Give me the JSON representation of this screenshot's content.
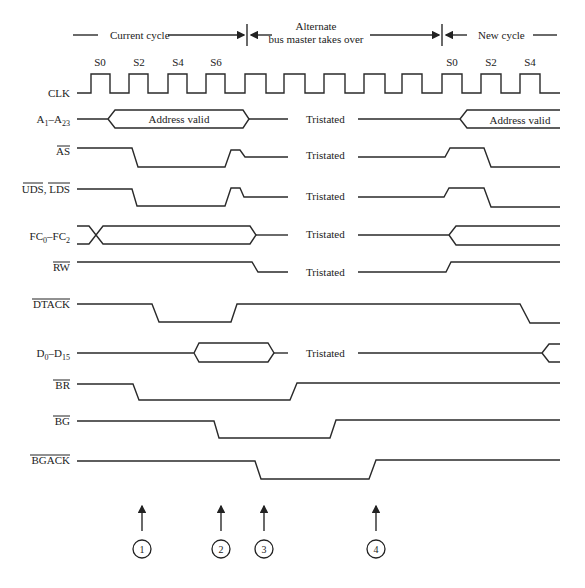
{
  "header": {
    "current_cycle": "Current cycle",
    "alternate_line1": "Alternate",
    "alternate_line2": "bus master takes over",
    "new_cycle": "New cycle",
    "dividers_x": [
      247,
      442
    ]
  },
  "clock": {
    "label": "CLK",
    "state_labels": [
      {
        "text": "S0",
        "x": 100
      },
      {
        "text": "S2",
        "x": 139
      },
      {
        "text": "S4",
        "x": 178
      },
      {
        "text": "S6",
        "x": 216
      },
      {
        "text": "S0",
        "x": 452
      },
      {
        "text": "S2",
        "x": 491
      },
      {
        "text": "S4",
        "x": 530
      }
    ]
  },
  "signals": [
    {
      "id": "address",
      "label": "A1–A23",
      "label_main": "A",
      "sub1": "1",
      "mid": "–A",
      "sub2": "23",
      "overbar": false,
      "text_in_bus": "Address valid",
      "tristated": "Tristated",
      "text_in_bus_right": "Address valid"
    },
    {
      "id": "as",
      "label": "AS",
      "overbar": true,
      "tristated": "Tristated"
    },
    {
      "id": "uds_lds",
      "label": "UDS, LDS",
      "overbar": true,
      "tristated": "Tristated"
    },
    {
      "id": "fc",
      "label": "FC0–FC2",
      "overbar": false,
      "tristated": "Tristated"
    },
    {
      "id": "rw",
      "label": "RW",
      "overbar": true,
      "tristated": "Tristated"
    },
    {
      "id": "dtack",
      "label": "DTACK",
      "overbar": true
    },
    {
      "id": "data",
      "label": "D0–D15",
      "overbar": false,
      "tristated": "Tristated"
    },
    {
      "id": "br",
      "label": "BR",
      "overbar": true
    },
    {
      "id": "bg",
      "label": "BG",
      "overbar": true
    },
    {
      "id": "bgack",
      "label": "BGACK",
      "overbar": true
    }
  ],
  "markers": [
    {
      "number": "1",
      "x": 142
    },
    {
      "number": "2",
      "x": 221
    },
    {
      "number": "3",
      "x": 264
    },
    {
      "number": "4",
      "x": 376
    }
  ]
}
